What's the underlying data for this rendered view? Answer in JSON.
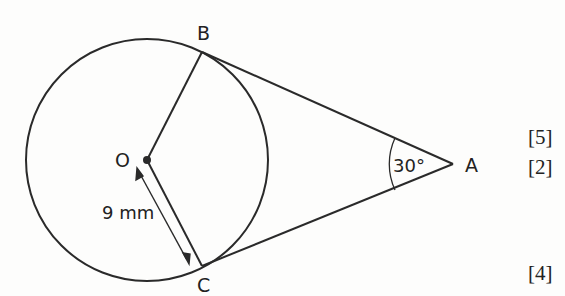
{
  "diagram": {
    "points": {
      "O": {
        "label": "O",
        "x": 147,
        "y": 160
      },
      "A": {
        "label": "A",
        "x": 453,
        "y": 160
      },
      "B": {
        "label": "B",
        "x": 202,
        "y": 51
      },
      "C": {
        "label": "C",
        "x": 202,
        "y": 267
      }
    },
    "circle": {
      "center": "O",
      "radius_px": 121
    },
    "segments": [
      "OB",
      "OC",
      "BA",
      "CA"
    ],
    "radius_label": "9 mm",
    "angle_label": "30°",
    "angle_at": "A",
    "colors": {
      "stroke": "#2a2a2a",
      "background": "#fdfdfc"
    }
  },
  "marks": [
    "[5]",
    "[2]",
    "[4]"
  ]
}
